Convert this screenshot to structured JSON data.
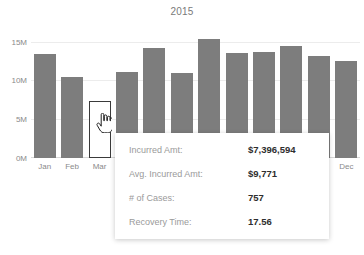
{
  "chart_data": {
    "type": "bar",
    "title": "2015",
    "xlabel": "",
    "ylabel": "",
    "ylim": [
      0,
      16500000
    ],
    "grid": true,
    "categories": [
      "Jan",
      "Feb",
      "Mar",
      "Apr",
      "May",
      "Jun",
      "Jul",
      "Aug",
      "Sep",
      "Oct",
      "Nov",
      "Dec"
    ],
    "visible_tick_labels": [
      "Jan",
      "Feb",
      "Mar",
      "Dec"
    ],
    "ytick_labels": [
      "0M",
      "5M",
      "10M",
      "15M"
    ],
    "ytick_values": [
      0,
      5000000,
      10000000,
      15000000
    ],
    "values": [
      13400000,
      10400000,
      7396594,
      11100000,
      14200000,
      10900000,
      15300000,
      13600000,
      13700000,
      14400000,
      13200000,
      12500000
    ],
    "series": [
      {
        "name": "Incurred Amt",
        "values": [
          13400000,
          10400000,
          7396594,
          11100000,
          14200000,
          10900000,
          15300000,
          13600000,
          13700000,
          14400000,
          13200000,
          12500000
        ]
      }
    ],
    "selected_index": 2,
    "bar_color": "#7d7d7d",
    "selected_bar_color": "#ffffff",
    "selected_bar_border_color": "#3a3a3a"
  },
  "tooltip": {
    "rows": [
      {
        "label": "Incurred Amt:",
        "value": "$7,396,594"
      },
      {
        "label": "Avg. Incurred Amt:",
        "value": "$9,771"
      },
      {
        "label": "# of Cases:",
        "value": "757"
      },
      {
        "label": "Recovery Time:",
        "value": "17.56"
      }
    ]
  },
  "cursor": {
    "icon": "pointing-hand-cursor"
  }
}
